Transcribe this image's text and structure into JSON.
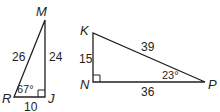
{
  "diagram": {
    "type": "geometry-right-triangles",
    "stroke_color": "#231f20",
    "triangles": [
      {
        "name": "triangle-RJM",
        "vertices": {
          "R": "R",
          "J": "J",
          "M": "M"
        },
        "sides": {
          "RM": "26",
          "JM": "24",
          "RJ": "10"
        },
        "angle_R": "67°",
        "right_angle_at": "J"
      },
      {
        "name": "triangle-KNP",
        "vertices": {
          "K": "K",
          "N": "N",
          "P": "P"
        },
        "sides": {
          "KP": "39",
          "KN": "15",
          "NP": "36"
        },
        "angle_P": "23°",
        "right_angle_at": "N"
      }
    ]
  }
}
